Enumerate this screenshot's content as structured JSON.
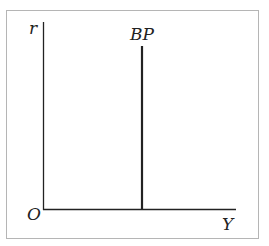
{
  "diagram": {
    "type": "economics-axes",
    "axes": {
      "y_label": "r",
      "x_label": "Y",
      "origin_label": "O"
    },
    "curves": [
      {
        "name": "BP",
        "label": "BP",
        "orientation": "vertical",
        "description": "Vertical balance of payments curve"
      }
    ],
    "colors": {
      "line": "#222222",
      "frame": "#b5b5b5",
      "background": "#ffffff"
    }
  }
}
